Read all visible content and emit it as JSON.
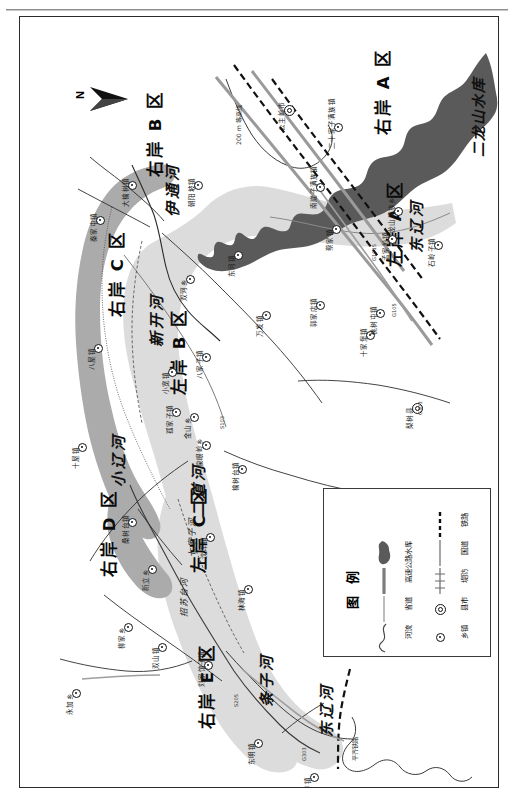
{
  "sheet": {
    "north_arrow_label": "N"
  },
  "zones": [
    {
      "name": "右岸 A 区",
      "x": 356,
      "y": 118
    },
    {
      "name": "左岸 A 区",
      "x": 368,
      "y": 250
    },
    {
      "name": "右岸 B 区",
      "x": 128,
      "y": 160
    },
    {
      "name": "左岸 B 区",
      "x": 152,
      "y": 378
    },
    {
      "name": "右岸 C 区",
      "x": 90,
      "y": 300
    },
    {
      "name": "左岸 C 区",
      "x": 172,
      "y": 556
    },
    {
      "name": "右岸 D 区",
      "x": 82,
      "y": 560
    },
    {
      "name": "右岸 E 区",
      "x": 180,
      "y": 712
    }
  ],
  "water_features": [
    {
      "name": "二龙山水库",
      "x": 452,
      "y": 140
    },
    {
      "name": "东辽河",
      "x": 390,
      "y": 236
    },
    {
      "name": "东辽河",
      "x": 300,
      "y": 720
    },
    {
      "name": "伊通河",
      "x": 146,
      "y": 200
    },
    {
      "name": "新开河",
      "x": 130,
      "y": 330
    },
    {
      "name": "小辽河",
      "x": 92,
      "y": 470
    },
    {
      "name": "二道河",
      "x": 172,
      "y": 500
    },
    {
      "name": "七家子河",
      "x": 168,
      "y": 540
    },
    {
      "name": "招苏台河",
      "x": 160,
      "y": 600
    },
    {
      "name": "条子河",
      "x": 240,
      "y": 690
    }
  ],
  "towns": [
    {
      "name": "公主岭市",
      "type": "city",
      "x": 268,
      "y": 92
    },
    {
      "name": "二十家子满族镇",
      "type": "town",
      "x": 318,
      "y": 110
    },
    {
      "name": "龙山满族乡",
      "type": "town",
      "x": 378,
      "y": 194
    },
    {
      "name": "南崴子满族镇",
      "type": "town",
      "x": 300,
      "y": 170
    },
    {
      "name": "蔡家镇",
      "type": "town",
      "x": 316,
      "y": 212
    },
    {
      "name": "郭家店镇",
      "type": "town",
      "x": 300,
      "y": 288
    },
    {
      "name": "孟家岭镇",
      "type": "town",
      "x": 372,
      "y": 222
    },
    {
      "name": "石岭子镇",
      "type": "town",
      "x": 418,
      "y": 228
    },
    {
      "name": "十家堡镇",
      "type": "town",
      "x": 350,
      "y": 318
    },
    {
      "name": "梨树县",
      "type": "city",
      "x": 396,
      "y": 390
    },
    {
      "name": "桃树屯镇",
      "type": "town",
      "x": 360,
      "y": 296
    },
    {
      "name": "朝阳坡镇",
      "type": "town",
      "x": 178,
      "y": 168
    },
    {
      "name": "大榆树镇",
      "type": "town",
      "x": 112,
      "y": 168
    },
    {
      "name": "秦家屯镇",
      "type": "town",
      "x": 80,
      "y": 203
    },
    {
      "name": "八屋镇",
      "type": "town",
      "x": 78,
      "y": 331
    },
    {
      "name": "十屋镇",
      "type": "town",
      "x": 62,
      "y": 430
    },
    {
      "name": "小宽镇",
      "type": "town",
      "x": 152,
      "y": 355
    },
    {
      "name": "孤家子镇",
      "type": "town",
      "x": 156,
      "y": 395
    },
    {
      "name": "八家子镇",
      "type": "town",
      "x": 186,
      "y": 340
    },
    {
      "name": "双河乡",
      "type": "town",
      "x": 170,
      "y": 262
    },
    {
      "name": "东河镇",
      "type": "town",
      "x": 218,
      "y": 238
    },
    {
      "name": "万发镇",
      "type": "town",
      "x": 246,
      "y": 298
    },
    {
      "name": "金山乡",
      "type": "town",
      "x": 174,
      "y": 400
    },
    {
      "name": "泉眼岭乡",
      "type": "town",
      "x": 186,
      "y": 428
    },
    {
      "name": "榆树台镇",
      "type": "town",
      "x": 222,
      "y": 452
    },
    {
      "name": "桑树台镇",
      "type": "town",
      "x": 112,
      "y": 505
    },
    {
      "name": "新立乡",
      "type": "town",
      "x": 132,
      "y": 552
    },
    {
      "name": "沈洋镇",
      "type": "town",
      "x": 190,
      "y": 520
    },
    {
      "name": "林海镇",
      "type": "town",
      "x": 228,
      "y": 572
    },
    {
      "name": "双山镇",
      "type": "town",
      "x": 142,
      "y": 630
    },
    {
      "name": "永加乡",
      "type": "town",
      "x": 56,
      "y": 676
    },
    {
      "name": "柳家乡",
      "type": "town",
      "x": 108,
      "y": 610
    },
    {
      "name": "刘家馆子镇",
      "type": "town",
      "x": 188,
      "y": 648
    },
    {
      "name": "东明镇",
      "type": "town",
      "x": 238,
      "y": 726
    },
    {
      "name": "王奔镇",
      "type": "town",
      "x": 294,
      "y": 760
    }
  ],
  "annotations": [
    {
      "text": "200 m 等高线",
      "x": 216,
      "y": 128
    },
    {
      "text": "平齐铁路",
      "x": 332,
      "y": 744
    }
  ],
  "road_numbers": [
    {
      "text": "G1015",
      "x": 352,
      "y": 244
    },
    {
      "text": "G105",
      "x": 372,
      "y": 300
    },
    {
      "text": "G303",
      "x": 398,
      "y": 398
    },
    {
      "text": "S103",
      "x": 200,
      "y": 412
    },
    {
      "text": "S205",
      "x": 214,
      "y": 690
    },
    {
      "text": "G303",
      "x": 282,
      "y": 744
    }
  ],
  "legend": {
    "title": "图 例",
    "columns": [
      {
        "items": [
          {
            "label": "乡镇",
            "symbol": "town-dot-icon"
          },
          {
            "label": "县市",
            "symbol": "city-circle-icon"
          },
          {
            "label": "堤防",
            "symbol": "levee-line-icon"
          },
          {
            "label": "国道",
            "symbol": "national-road-line-icon"
          },
          {
            "label": "铁路",
            "symbol": "railway-line-icon"
          }
        ]
      },
      {
        "items": [
          {
            "label": "河流",
            "symbol": "river-curve-icon"
          },
          {
            "label": "省道",
            "symbol": "provincial-road-line-icon"
          },
          {
            "label": "高速公路",
            "symbol": "expressway-line-icon"
          },
          {
            "label": "水库",
            "symbol": "reservoir-blob-icon"
          }
        ]
      }
    ]
  },
  "colors": {
    "floodplain_dark": "#a9a9a9",
    "floodplain_light": "#d8d8d8",
    "reservoir": "#5a5a5a",
    "line": "#1a1a1a",
    "road_grey": "#9a9a9a"
  }
}
